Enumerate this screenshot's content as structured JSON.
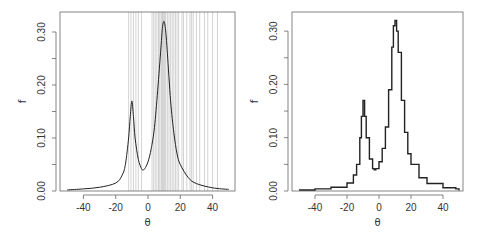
{
  "chart_data": [
    {
      "type": "line",
      "panel": "left",
      "title": "",
      "xlabel": "θ",
      "ylabel": "f",
      "xlim": [
        -55,
        52
      ],
      "ylim": [
        0,
        0.335
      ],
      "xticks": [
        -40,
        -20,
        0,
        20,
        40
      ],
      "xtick_labels": [
        "-40",
        "-20",
        "0",
        "20",
        "40"
      ],
      "yticks": [
        0.0,
        0.1,
        0.2,
        0.3
      ],
      "ytick_labels": [
        "0.00",
        "0.10",
        "0.20",
        "0.30"
      ],
      "grid": false,
      "description": "Bimodal density (mixture of two Cauchy-like peaks) with vertical gray rug lines marking observations",
      "series": [
        {
          "name": "density",
          "x": [
            -50,
            -40,
            -30,
            -20,
            -16,
            -14,
            -12,
            -11,
            -10,
            -9,
            -8,
            -6,
            -4,
            -3,
            -2,
            0,
            2,
            4,
            6,
            8,
            9,
            10,
            11,
            12,
            14,
            16,
            18,
            20,
            25,
            30,
            40,
            50
          ],
          "y": [
            0.002,
            0.004,
            0.007,
            0.015,
            0.03,
            0.05,
            0.1,
            0.14,
            0.17,
            0.14,
            0.1,
            0.06,
            0.042,
            0.04,
            0.042,
            0.055,
            0.08,
            0.12,
            0.19,
            0.27,
            0.31,
            0.32,
            0.3,
            0.26,
            0.17,
            0.11,
            0.07,
            0.05,
            0.025,
            0.014,
            0.006,
            0.003
          ]
        }
      ],
      "rug": [
        -12,
        -10.5,
        -9,
        -7.5,
        -6,
        -4,
        2.5,
        3.5,
        4.5,
        5.5,
        6.5,
        7,
        8,
        8.5,
        9,
        9.5,
        10,
        10.5,
        11,
        12,
        13,
        14,
        15,
        16,
        17,
        18,
        19,
        21,
        22,
        24,
        26,
        27,
        28,
        30,
        32,
        35,
        37,
        40,
        43
      ]
    },
    {
      "type": "line",
      "panel": "right",
      "title": "",
      "xlabel": "θ",
      "ylabel": "f",
      "xlim": [
        -55,
        52
      ],
      "ylim": [
        0,
        0.335
      ],
      "xticks": [
        -40,
        -20,
        0,
        20,
        40
      ],
      "xtick_labels": [
        "-40",
        "-20",
        "0",
        "20",
        "40"
      ],
      "yticks": [
        0.0,
        0.1,
        0.2,
        0.3
      ],
      "ytick_labels": [
        "0.00",
        "0.10",
        "0.20",
        "0.30"
      ],
      "grid": false,
      "description": "Step-function (histogram-like) estimate of the same bimodal density",
      "series": [
        {
          "name": "estimate",
          "x": [
            -50,
            -40,
            -30,
            -20,
            -16,
            -14,
            -12,
            -11,
            -10,
            -9,
            -8,
            -6,
            -4,
            -3,
            -2,
            0,
            2,
            4,
            6,
            8,
            9,
            10,
            11,
            12,
            14,
            16,
            18,
            20,
            25,
            30,
            40,
            48,
            50
          ],
          "y": [
            0.002,
            0.004,
            0.007,
            0.015,
            0.03,
            0.05,
            0.1,
            0.14,
            0.17,
            0.14,
            0.1,
            0.06,
            0.042,
            0.04,
            0.042,
            0.055,
            0.08,
            0.12,
            0.19,
            0.27,
            0.31,
            0.32,
            0.3,
            0.26,
            0.17,
            0.11,
            0.07,
            0.05,
            0.025,
            0.014,
            0.006,
            0.004,
            0.001
          ]
        }
      ]
    }
  ]
}
